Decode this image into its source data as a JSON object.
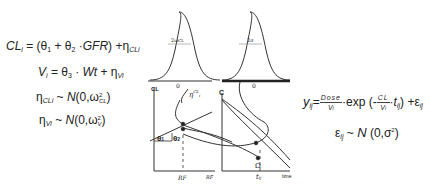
{
  "equations": {
    "cl": {
      "lhs": "CL",
      "lhs_sub": "i",
      "rhs_open": " = (θ",
      "t1_sub": "1",
      "plus": " + θ",
      "t2_sub": "2",
      "gfr": " ·GFR",
      "close": ") +η",
      "eta_sub": "CLi"
    },
    "v": {
      "lhs": "V",
      "lhs_sub": "i",
      "rhs": " = θ",
      "t3_sub": "3",
      "wt": " · Wt",
      "plus": " + η",
      "eta_sub": "Vi"
    },
    "eta_cl": {
      "lhs": "η",
      "lhs_sub": "CLi",
      "tilde": "  ~ ",
      "dist": "N",
      "args": "(0,ω",
      "w_sup": "2",
      "w_sub": "CL",
      "close": ")"
    },
    "eta_v": {
      "lhs": "η",
      "lhs_sub": "Vi",
      "tilde": "  ~ ",
      "dist": "N",
      "args": "(0,ω",
      "w_sup": "2",
      "w_sub": "V",
      "close": ")"
    },
    "y": {
      "lhs": "y",
      "lhs_sub": "ij",
      "eq": "=",
      "dose_num": "Dose",
      "dose_den": "V",
      "dose_den_sub": "i",
      "exp": "·exp (-",
      "cl_num": "CL",
      "cl_den": "V",
      "cl_den_sub": "i",
      "t": "·t",
      "t_sub": "ij",
      "close": ") +ε",
      "eps_sub": "ij"
    },
    "eps": {
      "lhs": "ε",
      "lhs_sub": "ij",
      "tilde": "  ~  ",
      "dist": "N",
      "args": " (0,σ",
      "sup": "2",
      "close": ")"
    }
  },
  "diagram": {
    "left_gaussian": {
      "width_label": "2ω",
      "width_label_sub": "CL",
      "center_label": "0",
      "sample_label": "η",
      "sample_sub": "i",
      "sample_sup": "CL"
    },
    "right_gaussian": {
      "width_label": "2σ",
      "center_label": "0"
    },
    "left_plot": {
      "y_axis_label": "CL",
      "x_axis_label": "RF",
      "x_tick": "RF",
      "slope_label": "θ",
      "slope_sub": "2",
      "intercept_label": "θ",
      "intercept_sub": "1"
    },
    "right_plot": {
      "y_axis_label": "C",
      "x_axis_label": "time",
      "x_tick": "t",
      "x_tick_sub": "ij",
      "point_label": "Ω",
      "curve_label": "y",
      "curve_label_sub": "ij"
    }
  },
  "colors": {
    "ink": "#222222",
    "line": "#333333",
    "axis": "#444444"
  }
}
